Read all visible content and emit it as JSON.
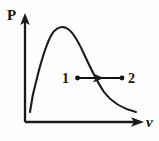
{
  "figure": {
    "kind": "physics-diagram",
    "background_color": "#fdfdfd",
    "ink_color": "#1a1a1a"
  },
  "axes": {
    "y_label": "P",
    "x_label": "v",
    "origin": {
      "x": 25,
      "y": 122
    },
    "y_axis_top": {
      "x": 25,
      "y": 16
    },
    "x_axis_right": {
      "x": 143,
      "y": 122
    },
    "y_arrow": "up-arrowhead",
    "x_arrow": "right-arrowhead"
  },
  "curve": {
    "name": "distribution-curve",
    "start": {
      "x": 30,
      "y": 112
    },
    "peak": {
      "x": 58,
      "y": 27
    },
    "end": {
      "x": 136,
      "y": 112
    },
    "path": "M30,112 C31,104 33,92 37,78 C41,62 46,44 52,34 C56,28 62,25 68,29 C74,33 79,43 84,54 C90,67 96,80 104,92 C112,103 124,109 136,112"
  },
  "process": {
    "name": "isobaric-process",
    "label_start": "1",
    "label_end": "2",
    "start_point": {
      "x": 77,
      "y": 78
    },
    "end_point": {
      "x": 122,
      "y": 78
    },
    "label_start_pos": {
      "x": 65,
      "y": 83
    },
    "label_end_pos": {
      "x": 129,
      "y": 83
    },
    "mid_arrow_x": 102,
    "direction": "left-to-right"
  },
  "chart_data": {
    "type": "line",
    "title": "",
    "xlabel": "v",
    "ylabel": "P",
    "grid": false,
    "legend": null,
    "axis_arrows": true,
    "x": [
      0.0,
      0.1,
      0.2,
      0.3,
      0.4,
      0.5,
      0.6,
      0.7,
      0.8,
      0.9,
      1.0
    ],
    "series": [
      {
        "name": "distribution",
        "values": [
          0.09,
          0.24,
          0.55,
          0.85,
          0.98,
          0.88,
          0.72,
          0.55,
          0.4,
          0.26,
          0.09
        ]
      }
    ],
    "annotations": [
      {
        "text": "1",
        "x": 0.47,
        "y": 0.42,
        "marker": "dot"
      },
      {
        "text": "2",
        "x": 0.9,
        "y": 0.42,
        "marker": "dot"
      },
      {
        "text": "",
        "type": "arrow",
        "from_x": 0.47,
        "to_x": 0.9,
        "y": 0.42
      }
    ],
    "xlim": [
      0,
      1.05
    ],
    "ylim": [
      0,
      1.05
    ]
  }
}
